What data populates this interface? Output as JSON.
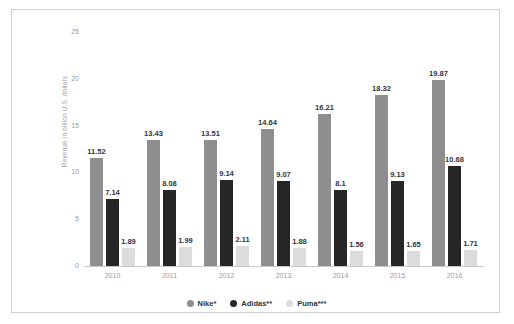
{
  "title_strip": "",
  "chart_data": {
    "type": "bar",
    "title": "",
    "xlabel": "",
    "ylabel": "Revenue in billion U.S. dollars",
    "ylim": [
      0,
      25
    ],
    "yticks": [
      0,
      5,
      10,
      15,
      20,
      25
    ],
    "grid": false,
    "legend_position": "bottom-center",
    "categories": [
      "2010",
      "2011",
      "2012",
      "2013",
      "2014",
      "2015",
      "2016"
    ],
    "series": [
      {
        "name": "Nike*",
        "color": "#8e8e8e",
        "values": [
          11.52,
          13.43,
          13.51,
          14.64,
          16.21,
          18.32,
          19.87
        ],
        "labels": [
          "11.52",
          "13.43",
          "13.51",
          "14.64",
          "16.21",
          "18.32",
          "19.87"
        ]
      },
      {
        "name": "Adidas**",
        "color": "#262626",
        "values": [
          7.14,
          8.08,
          9.14,
          9.07,
          8.1,
          9.13,
          10.68
        ],
        "labels": [
          "7.14",
          "8.08",
          "9.14",
          "9.07",
          "8.1",
          "9.13",
          "10.68"
        ]
      },
      {
        "name": "Puma***",
        "color": "#dcdcdc",
        "values": [
          1.89,
          1.99,
          2.11,
          1.88,
          1.56,
          1.65,
          1.71
        ],
        "labels": [
          "1.89",
          "1.99",
          "2.11",
          "1.88",
          "1.56",
          "1.65",
          "1.71"
        ]
      }
    ]
  }
}
